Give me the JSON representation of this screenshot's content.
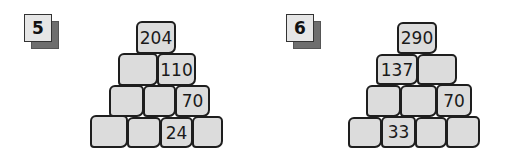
{
  "puzzles": [
    {
      "number": "5",
      "rows": [
        [
          "204"
        ],
        [
          "",
          "110"
        ],
        [
          "",
          "",
          "70"
        ],
        [
          "",
          "",
          "24",
          ""
        ]
      ]
    },
    {
      "number": "6",
      "rows": [
        [
          "290"
        ],
        [
          "137",
          ""
        ],
        [
          "",
          "",
          "70"
        ],
        [
          "",
          "33",
          "",
          ""
        ]
      ]
    }
  ],
  "colors": {
    "block_fill": "#dcdcdc",
    "block_border": "#1e1e1e",
    "badge_shadow": "#6e6e6e",
    "badge_face": "#e6e6e6"
  }
}
